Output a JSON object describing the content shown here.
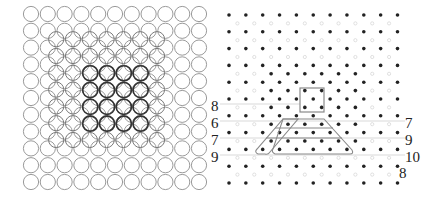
{
  "figure": {
    "left_panel": {
      "description": "square lattice of circles with overlaid offset lattice and highlighted 4x4 block",
      "grid_cols": 11,
      "grid_rows": 11,
      "highlight_block": "4x4",
      "colors": {
        "outline": "#9a9a9a",
        "highlight": "#333333"
      }
    },
    "right_panel": {
      "description": "dot lattice with square cell and trapezoid outlines",
      "grid_cols": 11,
      "grid_rows": 11,
      "left_labels": [
        "8",
        "6",
        "7",
        "9"
      ],
      "right_labels": [
        "7",
        "9",
        "10",
        "8"
      ],
      "colors": {
        "dot": "#222222",
        "outline": "#8a8a8a"
      }
    }
  }
}
